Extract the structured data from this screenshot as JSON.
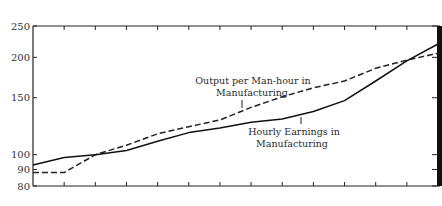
{
  "chart_data": {
    "type": "line",
    "title": "",
    "xlabel": "",
    "ylabel": "",
    "yscale": "log",
    "ylim": [
      80,
      250
    ],
    "yticks": [
      80,
      90,
      100,
      150,
      200,
      250
    ],
    "ytick_labels": [
      "80",
      "90",
      "100",
      "150",
      "200",
      "250"
    ],
    "x": [
      0,
      1,
      2,
      3,
      4,
      5,
      6,
      7,
      8,
      9,
      10,
      11,
      12,
      13
    ],
    "xtick_labels": [],
    "grid": false,
    "legend": "inline annotations",
    "series": [
      {
        "name": "Output per Man-hour in Manufacturing",
        "label_lines": [
          "Output per Man-hour in",
          "Manufacturing"
        ],
        "style": "dashed",
        "color": "#222222",
        "values": [
          88,
          88,
          100,
          107,
          116,
          122,
          128,
          140,
          151,
          161,
          169,
          185,
          196,
          206
        ]
      },
      {
        "name": "Hourly Earnings in Manufacturing",
        "label_lines": [
          "Hourly Earnings in",
          "Manufacturing"
        ],
        "style": "solid",
        "color": "#111111",
        "values": [
          93,
          98,
          100,
          103,
          110,
          117,
          121,
          126,
          129,
          136,
          147,
          169,
          195,
          220
        ]
      }
    ]
  }
}
